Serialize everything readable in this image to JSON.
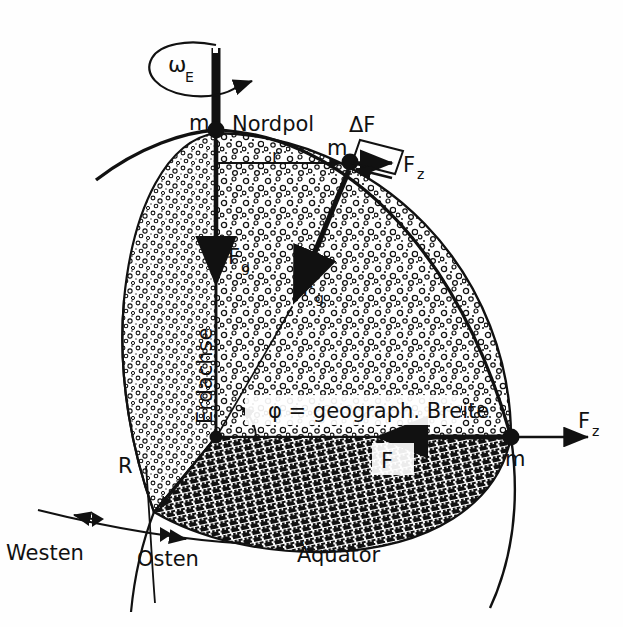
{
  "figure": {
    "language": "de",
    "background_color": "#fefefe",
    "ink_color": "#111111"
  },
  "labels": {
    "omega": "ω",
    "omega_sub": "E",
    "north_pole": "Nordpol",
    "mass_pole": "m",
    "mass_surface": "m",
    "mass_equator": "m",
    "radius_small": "r",
    "radius_big": "R",
    "delta_f": "ΔF",
    "fz_surface": "F",
    "fz_surface_sub": "z",
    "fz_equator": "F",
    "fz_equator_sub": "z",
    "fg_axis": "F",
    "fg_axis_sub": "g",
    "fg_radial": "F",
    "fg_radial_sub": "g",
    "f_equator": "F",
    "earth_axis": "Erdachse",
    "latitude": "φ = geograph. Breite",
    "equator": "Äquator",
    "west": "Westen",
    "east": "Osten"
  },
  "geometry": {
    "north_pole_point": [
      216,
      130
    ],
    "center_point": [
      216,
      437
    ],
    "surface_mass_point": [
      350,
      162
    ],
    "equator_mass_point": [
      511,
      437
    ],
    "earth_radius_px": 307,
    "axis_top": [
      216,
      48
    ],
    "latitude_angle_deg": 64
  },
  "annotations": {
    "rotation_arrow": "clockwise-rotation-ellipse",
    "cut_sphere": "quarter-cut-earth-sphere",
    "stipple_fill": "meridian-cut-surface",
    "hatch_fill": "equatorial-cut-plane"
  }
}
